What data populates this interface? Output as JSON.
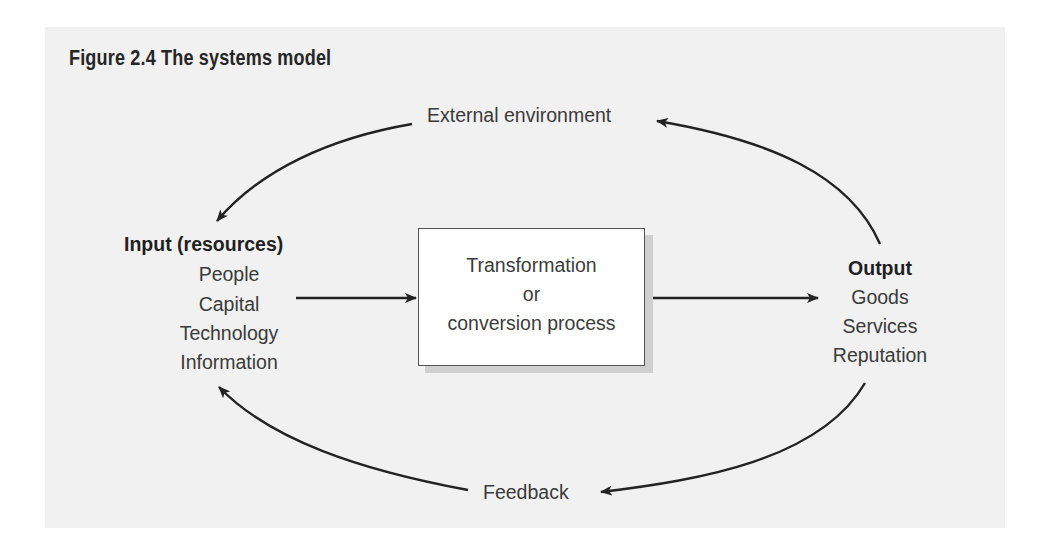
{
  "figure": {
    "title": "Figure 2.4  The systems model"
  },
  "nodes": {
    "external_environment": "External environment",
    "input": {
      "heading": "Input (resources)",
      "items": [
        "People",
        "Capital",
        "Technology",
        "Information"
      ]
    },
    "process": {
      "lines": [
        "Transformation",
        "or",
        "conversion process"
      ]
    },
    "output": {
      "heading": "Output",
      "items": [
        "Goods",
        "Services",
        "Reputation"
      ]
    },
    "feedback": "Feedback"
  },
  "edges": [
    {
      "from": "external_environment",
      "to": "input",
      "type": "curved"
    },
    {
      "from": "input",
      "to": "process",
      "type": "straight"
    },
    {
      "from": "process",
      "to": "output",
      "type": "straight"
    },
    {
      "from": "output",
      "to": "external_environment",
      "type": "curved"
    },
    {
      "from": "output",
      "to": "feedback",
      "type": "curved"
    },
    {
      "from": "feedback",
      "to": "input",
      "type": "curved"
    }
  ],
  "colors": {
    "background": "#f1f1f1",
    "text": "#3a3a3a",
    "line": "#222222"
  }
}
